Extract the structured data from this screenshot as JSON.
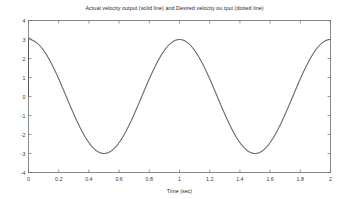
{
  "chart_data": {
    "type": "line",
    "title": "Actual velocity output (solid line) and Desired velocity ou tput (dotted line)",
    "xlabel": "Time (sec)",
    "ylabel": "",
    "xlim": [
      0,
      2
    ],
    "ylim": [
      -4,
      4
    ],
    "grid": false,
    "legend_position": "none",
    "xticks": [
      0,
      0.2,
      0.4,
      0.6,
      0.8,
      1,
      1.2,
      1.4,
      1.6,
      1.8,
      2
    ],
    "xticklabels": [
      "0",
      "0.2",
      "0.4",
      "0.6",
      "0.8",
      "1",
      "1.2",
      "1.4",
      "1.6",
      "1.8",
      "2"
    ],
    "yticks": [
      -4,
      -3,
      -2,
      -1,
      0,
      1,
      2,
      3,
      4
    ],
    "yticklabels": [
      "-4",
      "-3",
      "-2",
      "-1",
      "0",
      "1",
      "2",
      "3",
      "4"
    ],
    "series": [
      {
        "name": "Actual velocity output",
        "style": "solid",
        "color": "#4a4a4a",
        "description": "Step transient from 0 to 3 at t=0, then 3*cos(2*pi*t)",
        "x": [
          0,
          0.005,
          0.01,
          0.015,
          0.02,
          0.03,
          0.05,
          0.1,
          0.15,
          0.2,
          0.25,
          0.3,
          0.35,
          0.4,
          0.45,
          0.5,
          0.55,
          0.6,
          0.65,
          0.7,
          0.75,
          0.8,
          0.85,
          0.9,
          0.95,
          1,
          1.05,
          1.1,
          1.15,
          1.2,
          1.25,
          1.3,
          1.35,
          1.4,
          1.45,
          1.5,
          1.55,
          1.6,
          1.65,
          1.7,
          1.75,
          1.8,
          1.85,
          1.9,
          1.95,
          2
        ],
        "y": [
          0,
          1.6,
          2.6,
          3.02,
          3.1,
          3.05,
          2.99,
          2.85,
          2.6,
          2.27,
          1.77,
          1.18,
          0.52,
          -0.18,
          -0.88,
          -1.5,
          -2.1,
          -2.55,
          -2.85,
          -2.99,
          -3,
          -2.85,
          -2.55,
          -2.1,
          -1.5,
          -0.85,
          0,
          0.95,
          1.77,
          2.43,
          2.85,
          3,
          2.98,
          2.65,
          2.1,
          1.4,
          0.52,
          -0.4,
          -1.3,
          -2.1,
          -2.7,
          -2.98,
          -3,
          -2.7,
          -2.1,
          -1.25
        ]
      },
      {
        "name": "Desired velocity output",
        "style": "dotted",
        "color": "#9a9a9a",
        "description": "Overlaps the actual output after the initial transient"
      }
    ]
  },
  "figure": {
    "background_color": "#ffffff",
    "axes_color": "#6e6e6e",
    "curve_color": "#4a4a4a"
  }
}
